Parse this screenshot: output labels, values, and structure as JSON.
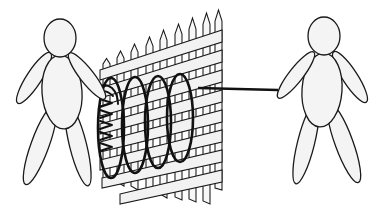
{
  "scene": {
    "title": "Two figures pulling a coiled spring attached to a lattice fence",
    "background_color": "#ffffff",
    "width": 384,
    "height": 209,
    "outline_color": "#1a1a1a",
    "fill_color": "#f4f4f4",
    "coil_color": "#111111",
    "slat_fill": "#f2f2f2"
  },
  "figures": [
    {
      "name": "left-figure",
      "label": "Left person",
      "facing": "right",
      "head": {
        "cx": 60,
        "cy": 38,
        "rx": 16,
        "ry": 19
      },
      "torso": {
        "cx": 62,
        "cy": 92,
        "rx": 20,
        "ry": 37,
        "rotate": -4
      },
      "arms": [
        {
          "name": "left-arm",
          "cx": 34,
          "cy": 78,
          "rx": 7.5,
          "ry": 30,
          "rotate": 33
        },
        {
          "name": "right-arm",
          "cx": 87,
          "cy": 76,
          "rx": 7,
          "ry": 29,
          "rotate": -38
        }
      ],
      "legs": [
        {
          "name": "left-leg",
          "cx": 40,
          "cy": 145,
          "rx": 9,
          "ry": 42,
          "rotate": 20
        },
        {
          "name": "right-leg",
          "cx": 78,
          "cy": 145,
          "rx": 8.5,
          "ry": 42,
          "rotate": -14
        }
      ],
      "hand_point": {
        "x": 105,
        "y": 92
      }
    },
    {
      "name": "right-figure",
      "label": "Right person",
      "facing": "left",
      "head": {
        "cx": 324,
        "cy": 36,
        "rx": 16,
        "ry": 19
      },
      "torso": {
        "cx": 322,
        "cy": 90,
        "rx": 20,
        "ry": 37,
        "rotate": 4
      },
      "arms": [
        {
          "name": "left-arm",
          "cx": 296,
          "cy": 75,
          "rx": 7,
          "ry": 29,
          "rotate": 38
        },
        {
          "name": "right-arm",
          "cx": 350,
          "cy": 77,
          "rx": 7.5,
          "ry": 30,
          "rotate": -33
        }
      ],
      "legs": [
        {
          "name": "left-leg",
          "cx": 306,
          "cy": 143,
          "rx": 8.5,
          "ry": 42,
          "rotate": 14
        },
        {
          "name": "right-leg",
          "cx": 344,
          "cy": 143,
          "rx": 9,
          "ry": 42,
          "rotate": -20
        }
      ],
      "hand_point": {
        "x": 277,
        "y": 90
      }
    }
  ],
  "spring": {
    "name": "coiled-spring",
    "label": "Coiled spring / helix",
    "turns": 4,
    "loops": [
      {
        "cx": 111,
        "cy": 128,
        "rx": 13,
        "ry": 50
      },
      {
        "cx": 135,
        "cy": 125,
        "rx": 13,
        "ry": 48
      },
      {
        "cx": 158,
        "cy": 122,
        "rx": 13,
        "ry": 46
      },
      {
        "cx": 180,
        "cy": 118,
        "rx": 13,
        "ry": 44
      }
    ],
    "zigzag_marks": 5,
    "attach_left": {
      "x": 105,
      "y": 92
    },
    "attach_right": {
      "x": 200,
      "y": 88
    }
  },
  "rope": {
    "name": "pull-rope",
    "label": "Rope to right figure",
    "from": {
      "x": 200,
      "y": 88
    },
    "to": {
      "x": 277,
      "y": 90
    }
  },
  "fence": {
    "name": "lattice-fence",
    "label": "Slatted lattice fence",
    "picket_count": 9,
    "rail_count": 8,
    "left_edge": 100,
    "right_edge": 222,
    "top_left_y": 62,
    "top_right_y": 22
  }
}
